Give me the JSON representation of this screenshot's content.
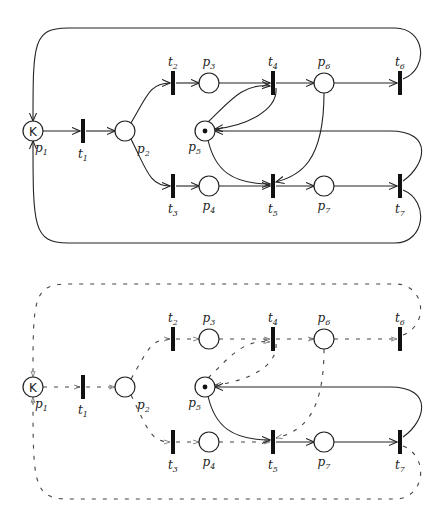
{
  "diagram": {
    "type": "petri-net",
    "nets": [
      {
        "id": "top",
        "offset_y": 0,
        "active_arcs": "all",
        "description": "Full Petri net with all arcs drawn solid"
      },
      {
        "id": "bottom",
        "offset_y": 256,
        "active_arcs": "subset",
        "description": "Same net, only arcs p5->t5, t5->p7, p7->t7, t7->p5 drawn solid; others dashed"
      }
    ],
    "places": [
      {
        "id": "p1",
        "label": "p",
        "sub": "1",
        "x": 33,
        "y": 131,
        "capacity": "K",
        "tokens": 0
      },
      {
        "id": "p2",
        "label": "p",
        "sub": "2",
        "x": 125,
        "y": 131,
        "tokens": 0
      },
      {
        "id": "p3",
        "label": "p",
        "sub": "3",
        "x": 209,
        "y": 83,
        "tokens": 0
      },
      {
        "id": "p4",
        "label": "p",
        "sub": "4",
        "x": 209,
        "y": 186,
        "tokens": 0
      },
      {
        "id": "p5",
        "label": "p",
        "sub": "5",
        "x": 205,
        "y": 131,
        "tokens": 1
      },
      {
        "id": "p6",
        "label": "p",
        "sub": "6",
        "x": 324,
        "y": 83,
        "tokens": 0
      },
      {
        "id": "p7",
        "label": "p",
        "sub": "7",
        "x": 324,
        "y": 186,
        "tokens": 0
      }
    ],
    "transitions": [
      {
        "id": "t1",
        "label": "t",
        "sub": "1",
        "x": 83,
        "y": 131
      },
      {
        "id": "t2",
        "label": "t",
        "sub": "2",
        "x": 173,
        "y": 83
      },
      {
        "id": "t3",
        "label": "t",
        "sub": "3",
        "x": 173,
        "y": 186
      },
      {
        "id": "t4",
        "label": "t",
        "sub": "4",
        "x": 273,
        "y": 83
      },
      {
        "id": "t5",
        "label": "t",
        "sub": "5",
        "x": 273,
        "y": 186
      },
      {
        "id": "t6",
        "label": "t",
        "sub": "6",
        "x": 400,
        "y": 83
      },
      {
        "id": "t7",
        "label": "t",
        "sub": "7",
        "x": 400,
        "y": 186
      }
    ],
    "arcs": [
      {
        "from": "p1",
        "to": "t1"
      },
      {
        "from": "t1",
        "to": "p2"
      },
      {
        "from": "p2",
        "to": "t2"
      },
      {
        "from": "p2",
        "to": "t3"
      },
      {
        "from": "t2",
        "to": "p3"
      },
      {
        "from": "t3",
        "to": "p4"
      },
      {
        "from": "p3",
        "to": "t4"
      },
      {
        "from": "p4",
        "to": "t5"
      },
      {
        "from": "t4",
        "to": "p6"
      },
      {
        "from": "t5",
        "to": "p7"
      },
      {
        "from": "p6",
        "to": "t6"
      },
      {
        "from": "p7",
        "to": "t7"
      },
      {
        "from": "p5",
        "to": "t4"
      },
      {
        "from": "t4",
        "to": "p5"
      },
      {
        "from": "p5",
        "to": "t5"
      },
      {
        "from": "p6",
        "to": "t5"
      },
      {
        "from": "t7",
        "to": "p5"
      },
      {
        "from": "t6",
        "to": "p1"
      },
      {
        "from": "t7",
        "to": "p1"
      }
    ]
  }
}
